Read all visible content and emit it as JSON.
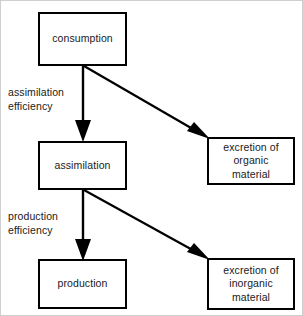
{
  "diagram": {
    "type": "flowchart",
    "stroke_color": "#000000",
    "text_color": "#1a1a1a",
    "background_color": "#ffffff",
    "nodes": [
      {
        "id": "consumption",
        "label": "consumption"
      },
      {
        "id": "assimilation",
        "label": "assimilation"
      },
      {
        "id": "production",
        "label": "production"
      },
      {
        "id": "excretion_organic",
        "label": "excretion of\norganic\nmaterial"
      },
      {
        "id": "excretion_inorganic",
        "label": "excretion of\ninorganic\nmaterial"
      }
    ],
    "edge_labels": [
      {
        "id": "assimilation_efficiency",
        "label": "assimilation\nefficiency"
      },
      {
        "id": "production_efficiency",
        "label": "production\nefficiency"
      }
    ],
    "edges": [
      {
        "from": "consumption",
        "to": "assimilation",
        "style": "vertical-arrow",
        "label": "assimilation efficiency"
      },
      {
        "from": "consumption",
        "to": "excretion_organic",
        "style": "diagonal-arrow",
        "label": ""
      },
      {
        "from": "assimilation",
        "to": "production",
        "style": "vertical-arrow",
        "label": "production efficiency"
      },
      {
        "from": "assimilation",
        "to": "excretion_inorganic",
        "style": "diagonal-arrow",
        "label": ""
      }
    ]
  }
}
